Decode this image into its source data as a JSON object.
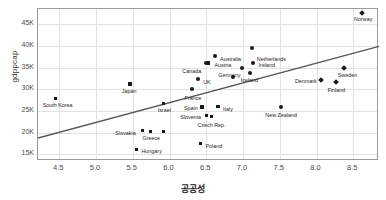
{
  "chart_data": {
    "type": "scatter",
    "title": "",
    "xlabel": "공공성",
    "ylabel": "gdppcap",
    "xlim": [
      4.21,
      8.85
    ],
    "ylim": [
      13500,
      48500
    ],
    "grid": true,
    "legend": "none",
    "xticks": [
      "4.5",
      "5.0",
      "5.5",
      "6.0",
      "6.5",
      "7.0",
      "7.5",
      "8.0",
      "8.5"
    ],
    "xtick_values": [
      4.5,
      5.0,
      5.5,
      6.0,
      6.5,
      7.0,
      7.5,
      8.0,
      8.5
    ],
    "yticks": [
      "15K",
      "20K",
      "25K",
      "30K",
      "35K",
      "40K",
      "45K"
    ],
    "ytick_values": [
      15000,
      20000,
      25000,
      30000,
      35000,
      40000,
      45000
    ],
    "trendline": {
      "x0": 4.21,
      "y0": 18800,
      "x1": 8.85,
      "y1": 39900,
      "color": "#555555"
    },
    "point_color": "#1a1a1a",
    "points": [
      {
        "label": "Norway",
        "x": 8.62,
        "y": 47600,
        "marker": "diamond",
        "lx": -8,
        "ly": 7
      },
      {
        "label": "Netherlands",
        "x": 7.12,
        "y": 39600,
        "marker": "circle",
        "lx": 5,
        "ly": 12
      },
      {
        "label": "Australia",
        "x": 6.62,
        "y": 37700,
        "marker": "circle",
        "lx": 5,
        "ly": 4
      },
      {
        "label": "Austria",
        "x": 6.53,
        "y": 36100,
        "marker": "square",
        "lx": 6,
        "ly": 3
      },
      {
        "label": "Ireland",
        "x": 7.13,
        "y": 36000,
        "marker": "circle",
        "lx": 6,
        "ly": 3
      },
      {
        "label": "Canada",
        "x": 6.5,
        "y": 36000,
        "marker": "circle",
        "lx": -24,
        "ly": 9
      },
      {
        "label": "Germany",
        "x": 6.99,
        "y": 34800,
        "marker": "circle",
        "lx": -24,
        "ly": 8
      },
      {
        "label": "Sweden",
        "x": 8.37,
        "y": 34900,
        "marker": "diamond",
        "lx": -6,
        "ly": 8
      },
      {
        "label": "Iceland",
        "x": 7.09,
        "y": 33800,
        "marker": "circle",
        "lx": -9,
        "ly": 8
      },
      {
        "label": "Iceland2",
        "x": 6.87,
        "y": 32900,
        "marker": "circle",
        "lx": 999,
        "ly": 999
      },
      {
        "label": "UK",
        "x": 6.39,
        "y": 32400,
        "marker": "circle",
        "lx": 5,
        "ly": 4
      },
      {
        "label": "Denmark",
        "x": 8.06,
        "y": 32200,
        "marker": "diamond",
        "lx": -26,
        "ly": 2
      },
      {
        "label": "Finland",
        "x": 8.26,
        "y": 31600,
        "marker": "diamond",
        "lx": -8,
        "ly": 9
      },
      {
        "label": "Japan",
        "x": 5.46,
        "y": 31200,
        "marker": "square",
        "lx": -8,
        "ly": 8
      },
      {
        "label": "France",
        "x": 6.3,
        "y": 30000,
        "marker": "circle",
        "lx": -7,
        "ly": 10
      },
      {
        "label": "South Korea",
        "x": 4.45,
        "y": 27900,
        "marker": "square",
        "lx": -13,
        "ly": 8
      },
      {
        "label": "Israel",
        "x": 5.92,
        "y": 26800,
        "marker": "square",
        "lx": -6,
        "ly": 8
      },
      {
        "label": "Italy",
        "x": 6.66,
        "y": 26000,
        "marker": "square",
        "lx": 5,
        "ly": 3
      },
      {
        "label": "Spain",
        "x": 6.44,
        "y": 25900,
        "marker": "square",
        "lx": -18,
        "ly": 2
      },
      {
        "label": "New Zealand",
        "x": 7.52,
        "y": 26000,
        "marker": "circle",
        "lx": -16,
        "ly": 9
      },
      {
        "label": "Slovenia",
        "x": 6.5,
        "y": 24000,
        "marker": "square",
        "lx": -26,
        "ly": 3
      },
      {
        "label": "Czech Rep.",
        "x": 6.57,
        "y": 23800,
        "marker": "square",
        "lx": -14,
        "ly": 10
      },
      {
        "label": "Greece",
        "x": 5.74,
        "y": 20300,
        "marker": "square",
        "lx": -8,
        "ly": 8
      },
      {
        "label": "Slovakia",
        "x": 5.63,
        "y": 20500,
        "marker": "square",
        "lx": -27,
        "ly": 3
      },
      {
        "label": "Greece2",
        "x": 5.92,
        "y": 20300,
        "marker": "square",
        "lx": 999,
        "ly": 999
      },
      {
        "label": "Poland",
        "x": 6.42,
        "y": 17500,
        "marker": "square",
        "lx": 5,
        "ly": 3
      },
      {
        "label": "Hungary",
        "x": 5.55,
        "y": 16200,
        "marker": "square",
        "lx": 5,
        "ly": 3
      }
    ]
  }
}
